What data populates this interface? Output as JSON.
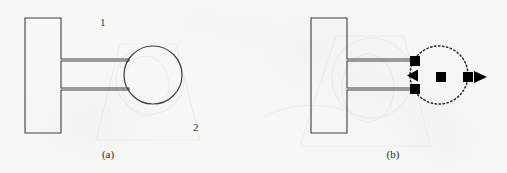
{
  "figure": {
    "background_color": "#f7f7f5",
    "stroke_color": "#3f3f3f",
    "fill_color": "#000000",
    "panels": [
      {
        "id": "a",
        "caption": "(a)",
        "caption_x": 108,
        "caption_y": 156,
        "circle_style": "solid",
        "labels": [
          {
            "text": "1",
            "x": 103,
            "y": 22
          },
          {
            "text": "2",
            "x": 196,
            "y": 128
          }
        ],
        "block": {
          "x": 25,
          "y": 18,
          "width": 36,
          "height": 115
        },
        "arms": [
          {
            "y": 60,
            "x_start": 61,
            "x_end": 128,
            "thickness": 1
          },
          {
            "y": 89,
            "x_start": 61,
            "x_end": 128,
            "thickness": 1
          }
        ],
        "circle": {
          "cx": 153,
          "cy": 75,
          "r": 29
        },
        "markers": []
      },
      {
        "id": "b",
        "caption": "(b)",
        "caption_x": 393,
        "caption_y": 156,
        "circle_style": "dotted",
        "labels": [],
        "block": {
          "x": 311,
          "y": 18,
          "width": 36,
          "height": 115
        },
        "arms": [
          {
            "y": 60,
            "x_start": 347,
            "x_end": 414,
            "thickness": 1
          },
          {
            "y": 89,
            "x_start": 347,
            "x_end": 414,
            "thickness": 1
          }
        ],
        "circle": {
          "cx": 439,
          "cy": 75,
          "r": 29
        },
        "markers": [
          {
            "kind": "square",
            "name": "contact-square-top",
            "cx": 415,
            "cy": 61,
            "size": 10
          },
          {
            "kind": "square",
            "name": "contact-square-bottom",
            "cx": 415,
            "cy": 89,
            "size": 10
          },
          {
            "kind": "triangle-left",
            "name": "reaction-arrow-left",
            "cx": 412,
            "cy": 75,
            "size": 11
          },
          {
            "kind": "square",
            "name": "center-square",
            "cx": 441,
            "cy": 77,
            "size": 10
          },
          {
            "kind": "square",
            "name": "contact-square-right",
            "cx": 468,
            "cy": 77,
            "size": 10
          },
          {
            "kind": "triangle-right",
            "name": "reaction-arrow-right",
            "cx": 481,
            "cy": 77,
            "size": 11
          }
        ]
      }
    ]
  }
}
